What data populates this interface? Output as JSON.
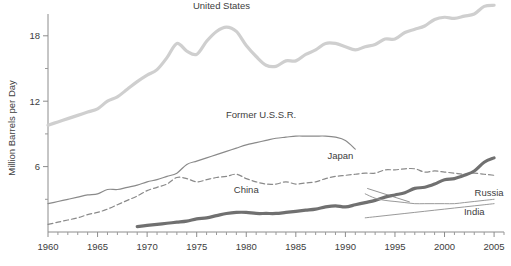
{
  "chart_data": {
    "type": "line",
    "title": "",
    "xlabel": "",
    "ylabel": "Million Barrels per Day",
    "xlim": [
      1960,
      2006
    ],
    "ylim": [
      0,
      20
    ],
    "grid": false,
    "legend": "inline-labels",
    "x_ticks_major": [
      1960,
      1965,
      1970,
      1975,
      1980,
      1985,
      1990,
      1995,
      2000,
      2005
    ],
    "x_tick_labels": [
      "1960",
      "1965",
      "1970",
      "1975",
      "1980",
      "1985",
      "1990",
      "1995",
      "2000",
      "2005"
    ],
    "x_minor_step": 1,
    "y_ticks_major": [
      6,
      12,
      18
    ],
    "y_tick_labels": [
      "6",
      "12",
      "18"
    ],
    "y_minor_ticks": [
      3,
      9,
      15
    ],
    "series": [
      {
        "name": "United States",
        "label": "United States",
        "style": "solid-thick-light",
        "color": "#cfcfcf",
        "width": 3.2,
        "x": [
          1960,
          1961,
          1962,
          1963,
          1964,
          1965,
          1966,
          1967,
          1968,
          1969,
          1970,
          1971,
          1972,
          1973,
          1974,
          1975,
          1976,
          1977,
          1978,
          1979,
          1980,
          1981,
          1982,
          1983,
          1984,
          1985,
          1986,
          1987,
          1988,
          1989,
          1990,
          1991,
          1992,
          1993,
          1994,
          1995,
          1996,
          1997,
          1998,
          1999,
          2000,
          2001,
          2002,
          2003,
          2004,
          2005
        ],
        "y": [
          9.8,
          10.1,
          10.4,
          10.7,
          11.0,
          11.3,
          12.0,
          12.4,
          13.1,
          13.8,
          14.4,
          14.9,
          16.0,
          17.3,
          16.6,
          16.3,
          17.5,
          18.4,
          18.8,
          18.4,
          17.1,
          16.1,
          15.3,
          15.2,
          15.7,
          15.7,
          16.3,
          16.7,
          17.3,
          17.3,
          17.0,
          16.7,
          17.0,
          17.2,
          17.7,
          17.7,
          18.3,
          18.6,
          18.9,
          19.5,
          19.7,
          19.6,
          19.8,
          20.0,
          20.7,
          20.8
        ]
      },
      {
        "name": "Former U.S.S.R.",
        "label": "Former U.S.S.R.",
        "style": "solid-medium",
        "color": "#8a8a8a",
        "width": 1.2,
        "x": [
          1960,
          1961,
          1962,
          1963,
          1964,
          1965,
          1966,
          1967,
          1968,
          1969,
          1970,
          1971,
          1972,
          1973,
          1974,
          1975,
          1976,
          1977,
          1978,
          1979,
          1980,
          1981,
          1982,
          1983,
          1984,
          1985,
          1986,
          1987,
          1988,
          1989,
          1990,
          1991
        ],
        "y": [
          2.6,
          2.8,
          3.0,
          3.2,
          3.4,
          3.5,
          3.9,
          3.9,
          4.1,
          4.3,
          4.6,
          4.8,
          5.1,
          5.4,
          6.2,
          6.5,
          6.8,
          7.1,
          7.4,
          7.7,
          8.0,
          8.2,
          8.4,
          8.6,
          8.7,
          8.8,
          8.8,
          8.8,
          8.8,
          8.7,
          8.4,
          7.6
        ]
      },
      {
        "name": "Japan",
        "label": "Japan",
        "style": "dashed",
        "color": "#8a8a8a",
        "width": 1.2,
        "x": [
          1960,
          1961,
          1962,
          1963,
          1964,
          1965,
          1966,
          1967,
          1968,
          1969,
          1970,
          1971,
          1972,
          1973,
          1974,
          1975,
          1976,
          1977,
          1978,
          1979,
          1980,
          1981,
          1982,
          1983,
          1984,
          1985,
          1986,
          1987,
          1988,
          1989,
          1990,
          1991,
          1992,
          1993,
          1994,
          1995,
          1996,
          1997,
          1998,
          1999,
          2000,
          2001,
          2002,
          2003,
          2004,
          2005
        ],
        "y": [
          0.7,
          0.9,
          1.1,
          1.3,
          1.6,
          1.8,
          2.1,
          2.5,
          2.9,
          3.3,
          3.8,
          4.1,
          4.4,
          5.0,
          4.9,
          4.6,
          4.8,
          5.0,
          5.1,
          5.3,
          4.9,
          4.6,
          4.4,
          4.4,
          4.6,
          4.4,
          4.5,
          4.6,
          4.9,
          5.1,
          5.2,
          5.3,
          5.4,
          5.4,
          5.7,
          5.7,
          5.8,
          5.8,
          5.5,
          5.6,
          5.5,
          5.4,
          5.3,
          5.4,
          5.3,
          5.2
        ]
      },
      {
        "name": "China",
        "label": "China",
        "style": "solid-thick-dark",
        "color": "#707070",
        "width": 3.2,
        "x": [
          1969,
          1970,
          1971,
          1972,
          1973,
          1974,
          1975,
          1976,
          1977,
          1978,
          1979,
          1980,
          1981,
          1982,
          1983,
          1984,
          1985,
          1986,
          1987,
          1988,
          1989,
          1990,
          1991,
          1992,
          1993,
          1994,
          1995,
          1996,
          1997,
          1998,
          1999,
          2000,
          2001,
          2002,
          2003,
          2004,
          2005
        ],
        "y": [
          0.5,
          0.6,
          0.7,
          0.8,
          0.9,
          1.0,
          1.2,
          1.3,
          1.5,
          1.7,
          1.8,
          1.8,
          1.7,
          1.7,
          1.7,
          1.8,
          1.9,
          2.0,
          2.1,
          2.3,
          2.4,
          2.3,
          2.5,
          2.7,
          2.9,
          3.2,
          3.4,
          3.6,
          4.0,
          4.1,
          4.4,
          4.8,
          4.9,
          5.2,
          5.6,
          6.4,
          6.8
        ]
      },
      {
        "name": "Russia",
        "label": "Russia",
        "style": "solid-thin",
        "color": "#9a9a9a",
        "width": 1.0,
        "x": [
          1992,
          1993,
          1994,
          1995,
          1996,
          1997,
          1998,
          1999,
          2000,
          2001,
          2002,
          2003,
          2004,
          2005
        ],
        "y": [
          3.5,
          3.1,
          2.9,
          2.8,
          2.7,
          2.6,
          2.6,
          2.6,
          2.6,
          2.6,
          2.7,
          2.8,
          2.9,
          3.0
        ]
      },
      {
        "name": "India",
        "label": "India",
        "style": "solid-thin",
        "color": "#9a9a9a",
        "width": 1.0,
        "x": [
          1992,
          1993,
          1994,
          1995,
          1996,
          1997,
          1998,
          1999,
          2000,
          2001,
          2002,
          2003,
          2004,
          2005
        ],
        "y": [
          1.3,
          1.4,
          1.5,
          1.6,
          1.7,
          1.8,
          1.9,
          2.0,
          2.1,
          2.2,
          2.3,
          2.4,
          2.5,
          2.6
        ]
      }
    ],
    "annotations": [
      {
        "name": "united-states-label",
        "text": "United States",
        "x": 1977.5,
        "y": 20.5
      },
      {
        "name": "former-ussr-label",
        "text": "Former U.S.S.R.",
        "x": 1981.5,
        "y": 10.5
      },
      {
        "name": "japan-label",
        "text": "Japan",
        "x": 1989.5,
        "y": 6.7
      },
      {
        "name": "china-label",
        "text": "China",
        "x": 1980.0,
        "y": 3.6
      },
      {
        "name": "russia-label",
        "text": "Russia",
        "x": 2004.5,
        "y": 3.3
      },
      {
        "name": "india-label",
        "text": "India",
        "x": 2003.0,
        "y": 1.6
      }
    ]
  }
}
